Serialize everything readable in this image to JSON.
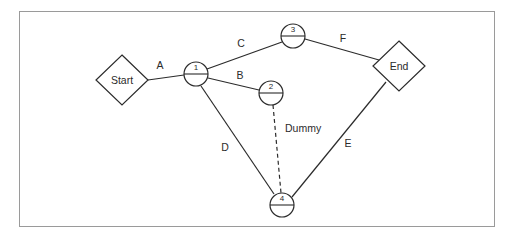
{
  "diagram": {
    "type": "activity-on-arrow-network",
    "title": "",
    "frame": {
      "border_color": "#9a9a9a",
      "background": "#ffffff"
    },
    "line_color": "#2b2b2b",
    "terminals": [
      {
        "id": "start",
        "label": "Start",
        "shape": "diamond",
        "x": 122,
        "y": 80,
        "rx": 26,
        "ry": 25
      },
      {
        "id": "end",
        "label": "End",
        "shape": "diamond",
        "x": 399,
        "y": 66,
        "rx": 26,
        "ry": 25
      }
    ],
    "nodes": [
      {
        "id": "n1",
        "label": "1",
        "shape": "divided-circle",
        "x": 196,
        "y": 74,
        "r": 12
      },
      {
        "id": "n2",
        "label": "2",
        "shape": "divided-circle",
        "x": 271,
        "y": 93,
        "r": 12
      },
      {
        "id": "n3",
        "label": "3",
        "shape": "divided-circle",
        "x": 293,
        "y": 36,
        "r": 12
      },
      {
        "id": "n4",
        "label": "4",
        "shape": "divided-circle",
        "x": 282,
        "y": 205,
        "r": 12
      }
    ],
    "edges": [
      {
        "id": "A",
        "label": "A",
        "from": "start",
        "to": "n1",
        "style": "solid",
        "label_x": 160,
        "label_y": 66
      },
      {
        "id": "C",
        "label": "C",
        "from": "n1",
        "to": "n3",
        "style": "solid",
        "label_x": 241,
        "label_y": 44
      },
      {
        "id": "B",
        "label": "B",
        "from": "n1",
        "to": "n2",
        "style": "solid",
        "label_x": 240,
        "label_y": 76
      },
      {
        "id": "F",
        "label": "F",
        "from": "n3",
        "to": "end",
        "style": "solid",
        "label_x": 343,
        "label_y": 39
      },
      {
        "id": "D",
        "label": "D",
        "from": "n1",
        "to": "n4",
        "style": "solid",
        "label_x": 225,
        "label_y": 148
      },
      {
        "id": "E",
        "label": "E",
        "from": "n4",
        "to": "end",
        "style": "solid",
        "label_x": 348,
        "label_y": 144
      },
      {
        "id": "Dummy",
        "label": "Dummy",
        "from": "n2",
        "to": "n4",
        "style": "dashed",
        "label_x": 280,
        "label_y": 129
      }
    ]
  }
}
